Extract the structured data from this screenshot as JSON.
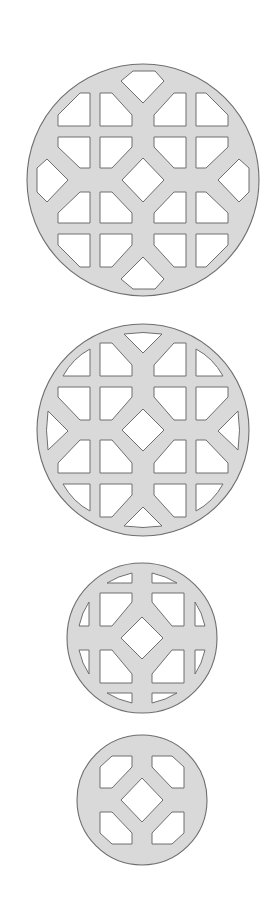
{
  "figure": {
    "title": "",
    "colors": {
      "background": "#ffffff",
      "fill": "#d9d9d9",
      "outline": "#6e6e6e",
      "hole": "#ffffff"
    },
    "shapes": [
      {
        "name": "lattice-large-4x4",
        "cx": 143,
        "cy": 180,
        "r": 116,
        "grid": "4x4 with hexagon side holes and central diamond"
      },
      {
        "name": "lattice-medium-4x4",
        "cx": 143,
        "cy": 430,
        "r": 106,
        "grid": "4x4 with triangular side holes and central diamond"
      },
      {
        "name": "lattice-small-2x2",
        "cx": 142,
        "cy": 638,
        "r": 75,
        "grid": "2x2 with circle-segment side holes and central diamond"
      },
      {
        "name": "lattice-smallest-2x2",
        "cx": 142,
        "cy": 800,
        "r": 65,
        "grid": "2x2 chamfered holes and central diamond"
      }
    ]
  }
}
